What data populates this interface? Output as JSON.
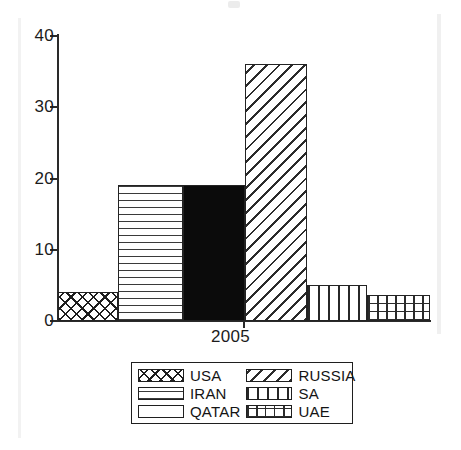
{
  "chart_data": {
    "type": "bar",
    "title": "",
    "subtitle": "",
    "xlabel": "2005",
    "ylabel": "",
    "categories": [
      "USA",
      "IRAN",
      "QATAR",
      "RUSSIA",
      "SA",
      "UAE"
    ],
    "values": [
      4,
      19,
      19,
      36,
      5,
      3.7
    ],
    "ylim": [
      0,
      40
    ],
    "y_ticks": [
      0,
      10,
      20,
      30,
      40
    ],
    "y_tick_labels": [
      "0",
      "10",
      "20",
      "30",
      "40"
    ],
    "x_tick_labels": [
      "2005"
    ],
    "grid": false,
    "legend_position": "bottom",
    "series": [
      {
        "name": "USA",
        "value": 4,
        "pattern": "cross-diamond-hatch",
        "color": "#1e1e1e"
      },
      {
        "name": "IRAN",
        "value": 19,
        "pattern": "horizontal-lines",
        "color": "#3a3a3a"
      },
      {
        "name": "QATAR",
        "value": 19,
        "pattern": "solid-fill",
        "color": "#0b0b0b"
      },
      {
        "name": "RUSSIA",
        "value": 36,
        "pattern": "back-diagonal-hatch",
        "color": "#2b2b2b"
      },
      {
        "name": "SA",
        "value": 5,
        "pattern": "vertical-lines",
        "color": "#272727"
      },
      {
        "name": "UAE",
        "value": 3.7,
        "pattern": "grid-hatch",
        "color": "#2b2b2b"
      }
    ],
    "legend": [
      {
        "label": "USA",
        "pattern": "cross-diamond-hatch"
      },
      {
        "label": "RUSSIA",
        "pattern": "back-diagonal-hatch"
      },
      {
        "label": "IRAN",
        "pattern": "horizontal-lines"
      },
      {
        "label": "SA",
        "pattern": "vertical-lines"
      },
      {
        "label": "QATAR",
        "pattern": "solid-fill"
      },
      {
        "label": "UAE",
        "pattern": "grid-hatch"
      }
    ],
    "axis_color": "#2a2a2a",
    "background": "#ffffff"
  }
}
